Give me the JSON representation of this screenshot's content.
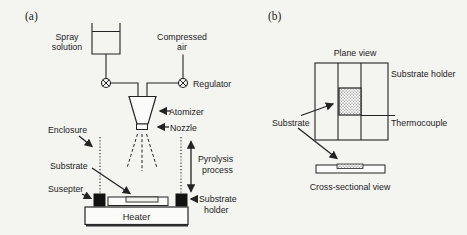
{
  "figure": {
    "paper_color": "#f4f4f1",
    "ink_color": "#232323",
    "icons": {
      "valve": "circle-x-valve-icon",
      "arrow": "filled-arrowhead"
    },
    "panel_a": {
      "tag": "(a)",
      "labels": {
        "spray_solution": [
          "Spray",
          "solution"
        ],
        "compressed_air": [
          "Compressed",
          "air"
        ],
        "regulator": "Regulator",
        "atomizer": "Atomizer",
        "nozzle": "Nozzle",
        "enclosure": "Enclosure",
        "substrate": "Substrate",
        "susepter": "Susepter",
        "heater": "Heater",
        "pyrolysis_process": [
          "Pyrolysis",
          "process"
        ],
        "substrate_holder": [
          "Substrate",
          "holder"
        ]
      }
    },
    "panel_b": {
      "tag": "(b)",
      "labels": {
        "plane_view": "Plane view",
        "substrate_holder": "Substrate holder",
        "thermocouple": "Thermocouple",
        "substrate": "Substrate",
        "cross_sectional_view": "Cross-sectional view"
      }
    }
  }
}
